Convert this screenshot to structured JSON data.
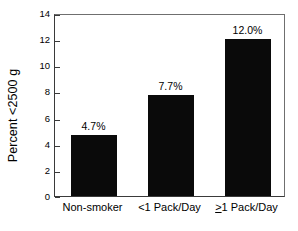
{
  "chart_data": {
    "type": "bar",
    "title": "",
    "xlabel": "",
    "ylabel": "Percent <2500 g",
    "categories": [
      "Non-smoker",
      "<1 Pack/Day",
      "≥1 Pack/Day"
    ],
    "values": [
      4.7,
      7.7,
      12.0
    ],
    "data_labels": [
      "4.7%",
      "7.7%",
      "12.0%"
    ],
    "ylim": [
      0,
      14
    ],
    "yticks": [
      0,
      2,
      4,
      6,
      8,
      10,
      12,
      14
    ],
    "ytick_labels": [
      "0",
      "2",
      "4",
      "6",
      "8",
      "10",
      "12",
      "14"
    ],
    "grid": false,
    "legend": null,
    "bar_color": "#0a0a0a",
    "background_color": "#ffffff",
    "axis_color": "#3a3a3a",
    "category_label_parts": [
      {
        "prefix": "",
        "symbol": "",
        "suffix": "Non-smoker"
      },
      {
        "prefix": "",
        "symbol": "<",
        "suffix": "1 Pack/Day"
      },
      {
        "prefix": "",
        "symbol": ">",
        "suffix": "1 Pack/Day"
      }
    ]
  }
}
